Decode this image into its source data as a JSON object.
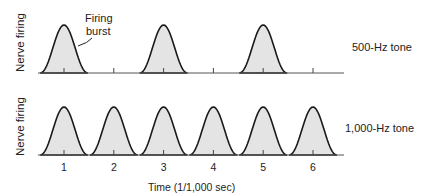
{
  "figure": {
    "panels": [
      {
        "id": "top",
        "y_label": "Nerve firing",
        "tone_label": "500-Hz tone",
        "bursts_at": [
          1,
          3,
          5
        ],
        "annotation": {
          "line1": "Firing",
          "line2": "burst"
        }
      },
      {
        "id": "bottom",
        "y_label": "Nerve firing",
        "tone_label": "1,000-Hz tone",
        "bursts_at": [
          1,
          2,
          3,
          4,
          5,
          6
        ]
      }
    ],
    "x_ticks": [
      "1",
      "2",
      "3",
      "4",
      "5",
      "6"
    ],
    "x_label": "Time (1/1,000 sec)",
    "colors": {
      "stroke": "#1a1a1a",
      "fill": "#e4e4e4",
      "axis": "#555555"
    }
  }
}
